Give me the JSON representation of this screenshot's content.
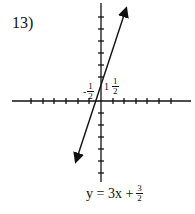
{
  "problem_number": "13)",
  "equation": {
    "lhs": "y = 3x +",
    "num": "3",
    "den": "2"
  },
  "labels": {
    "y_intercept": {
      "whole": "1",
      "num": "1",
      "den": "2"
    },
    "x_intercept": {
      "sign": "-",
      "num": "1",
      "den": "2"
    }
  },
  "colors": {
    "ink": "#111111",
    "background": "#ffffff"
  }
}
